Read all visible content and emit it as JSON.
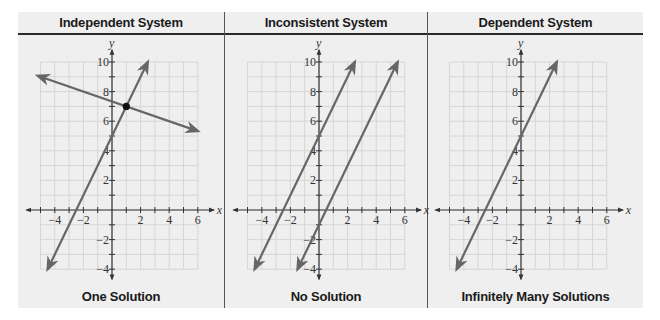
{
  "figure": {
    "background": "#efefef",
    "grid_color": "#d6d6d6",
    "axis_color": "#333333",
    "line_color": "#666666"
  },
  "panels": [
    {
      "title": "Independent System",
      "caption": "One Solution"
    },
    {
      "title": "Inconsistent System",
      "caption": "No Solution"
    },
    {
      "title": "Dependent System",
      "caption": "Infinitely Many Solutions"
    }
  ],
  "chart_data": [
    {
      "type": "line",
      "title": "Independent System",
      "caption": "One Solution",
      "xlabel": "x",
      "ylabel": "y",
      "xlim": [
        -5,
        6
      ],
      "ylim": [
        -4,
        10
      ],
      "grid": true,
      "xticks": [
        -4,
        -2,
        2,
        4,
        6
      ],
      "yticks": [
        -4,
        -2,
        2,
        4,
        6,
        8,
        10
      ],
      "series": [
        {
          "name": "y = 2x + 5",
          "slope": 2,
          "intercept": 5,
          "x": [
            -4.5,
            2.5
          ],
          "y": [
            -4,
            10
          ]
        },
        {
          "name": "y = -x/3 + 22/3",
          "slope": -0.3333,
          "intercept": 7.3333,
          "x": [
            -5.2,
            6
          ],
          "y": [
            9.07,
            5.33
          ]
        }
      ],
      "points": [
        {
          "x": 1,
          "y": 7,
          "label": "intersection"
        }
      ]
    },
    {
      "type": "line",
      "title": "Inconsistent System",
      "caption": "No Solution",
      "xlabel": "x",
      "ylabel": "y",
      "xlim": [
        -5,
        6
      ],
      "ylim": [
        -4,
        10
      ],
      "grid": true,
      "xticks": [
        -4,
        -2,
        2,
        4,
        6
      ],
      "yticks": [
        -4,
        -2,
        2,
        4,
        6,
        8,
        10
      ],
      "series": [
        {
          "name": "y = 2x + 5",
          "slope": 2,
          "intercept": 5,
          "x": [
            -4.5,
            2.5
          ],
          "y": [
            -4,
            10
          ]
        },
        {
          "name": "y = 2x - 1",
          "slope": 2,
          "intercept": -1,
          "x": [
            -1.5,
            5.5
          ],
          "y": [
            -4,
            10
          ]
        }
      ],
      "points": []
    },
    {
      "type": "line",
      "title": "Dependent System",
      "caption": "Infinitely Many Solutions",
      "xlabel": "x",
      "ylabel": "y",
      "xlim": [
        -5,
        6
      ],
      "ylim": [
        -4,
        10
      ],
      "grid": true,
      "xticks": [
        -4,
        -2,
        2,
        4,
        6
      ],
      "yticks": [
        -4,
        -2,
        2,
        4,
        6,
        8,
        10
      ],
      "series": [
        {
          "name": "y = 2x + 5",
          "slope": 2,
          "intercept": 5,
          "x": [
            -4.5,
            2.5
          ],
          "y": [
            -4,
            10
          ]
        }
      ],
      "points": []
    }
  ]
}
